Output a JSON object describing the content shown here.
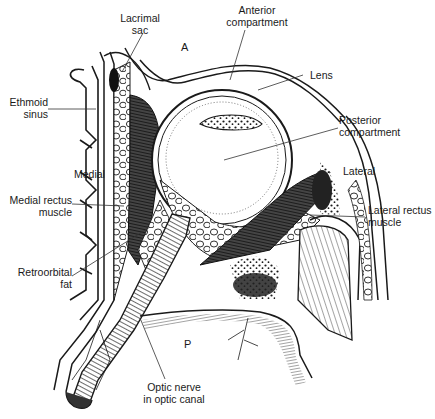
{
  "figure": {
    "type": "anatomical-diagram",
    "region_letters": {
      "anterior": "A",
      "posterior": "P"
    },
    "labels": [
      {
        "id": "lacrimal-sac",
        "line1": "Lacrimal",
        "line2": "sac"
      },
      {
        "id": "anterior-compartment",
        "line1": "Anterior",
        "line2": "compartment"
      },
      {
        "id": "lens",
        "line1": "Lens",
        "line2": ""
      },
      {
        "id": "ethmoid-sinus",
        "line1": "Ethmoid",
        "line2": "sinus"
      },
      {
        "id": "posterior-compartment",
        "line1": "Posterior",
        "line2": "compartment"
      },
      {
        "id": "medial",
        "line1": "Medial",
        "line2": ""
      },
      {
        "id": "lateral",
        "line1": "Lateral",
        "line2": ""
      },
      {
        "id": "medial-rectus-muscle",
        "line1": "Medial rectus",
        "line2": "muscle"
      },
      {
        "id": "lateral-rectus-muscle",
        "line1": "Lateral rectus",
        "line2": "muscle"
      },
      {
        "id": "retroorbital-fat",
        "line1": "Retroorbital",
        "line2": "fat"
      },
      {
        "id": "optic-nerve",
        "line1": "Optic nerve",
        "line2": "in optic canal"
      }
    ]
  },
  "colors": {
    "ink": "#1a1a1a",
    "background": "#ffffff",
    "leader": "#333333"
  }
}
